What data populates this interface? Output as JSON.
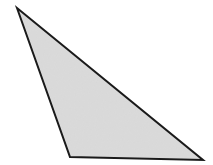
{
  "canvas": {
    "width": 213,
    "height": 165,
    "background_color": "#ffffff",
    "name": "geometry-figure"
  },
  "figure": {
    "type": "polygon",
    "shape_name": "triangle",
    "fill_color": "#dedede",
    "stroke_color": "#1a1a1a",
    "stroke_width": 2,
    "points": "17,8 70,157 203,160",
    "vertices": [
      {
        "label": "apex",
        "x": 17,
        "y": 8
      },
      {
        "label": "bottom-left",
        "x": 70,
        "y": 157
      },
      {
        "label": "bottom-right",
        "x": 203,
        "y": 160
      }
    ],
    "edges": [
      {
        "label": "left-edge",
        "from": "apex",
        "to": "bottom-left"
      },
      {
        "label": "base-edge",
        "from": "bottom-left",
        "to": "bottom-right"
      },
      {
        "label": "hypotenuse-edge",
        "from": "bottom-right",
        "to": "apex"
      }
    ],
    "texture": {
      "name": "paper-grain",
      "enabled": true,
      "opacity": 0.16
    }
  }
}
